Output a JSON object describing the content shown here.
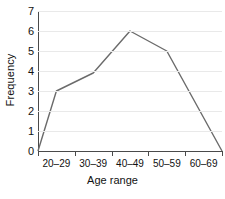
{
  "chart_data": {
    "type": "line",
    "title": "",
    "xlabel": "Age range",
    "ylabel": "Frequency",
    "categories": [
      "20–29",
      "30–39",
      "40–49",
      "50–59",
      "60–69"
    ],
    "values": [
      3,
      3.9,
      6,
      5,
      0
    ],
    "series": [
      {
        "name": "Frequency",
        "values": [
          3,
          3.9,
          6,
          5,
          0
        ]
      }
    ],
    "points": [
      {
        "x": 0,
        "y": 0,
        "label": "axis origin"
      },
      {
        "x": 0.5,
        "y": 3,
        "label": "20–29"
      },
      {
        "x": 1.5,
        "y": 3.9,
        "label": "30–39"
      },
      {
        "x": 2.5,
        "y": 6,
        "label": "40–49"
      },
      {
        "x": 3.5,
        "y": 5,
        "label": "50–59"
      },
      {
        "x": 5,
        "y": 0,
        "label": "60–69 end"
      }
    ],
    "ylim": [
      0,
      7
    ],
    "yticks": [
      0,
      1,
      2,
      3,
      4,
      5,
      6,
      7
    ],
    "ytick_labels": [
      "0",
      "1",
      "2",
      "3",
      "4",
      "5",
      "6",
      "7"
    ],
    "xlim": [
      0,
      5
    ],
    "grid": true,
    "grid_axis": "y",
    "legend": false,
    "line_color": "#6b6b6b",
    "grid_color": "#e9e9e9",
    "axis_color": "#4a4a4a",
    "background_color": "#ffffff"
  }
}
